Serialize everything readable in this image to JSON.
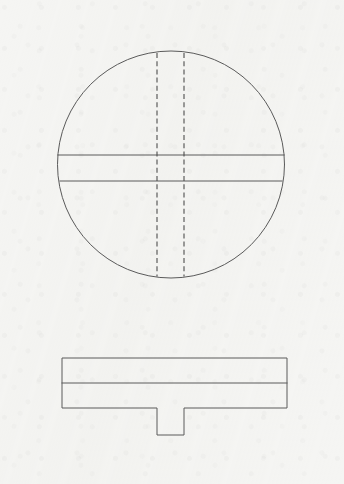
{
  "page": {
    "width": 344,
    "height": 484,
    "background_color": "#f5f5f3",
    "line_color": "#5a5a5a",
    "hidden_line_color": "#4e4e4e",
    "medium": "scanned paper"
  },
  "views": [
    {
      "id": "top-view",
      "name": "Top View (Plan)",
      "shape": "circle",
      "center": {
        "x": 171,
        "y": 164.5
      },
      "radius": 113.5,
      "bounds": {
        "left": 57.5,
        "top": 51,
        "right": 284.5,
        "bottom": 278
      },
      "features": [
        {
          "id": "chord-line-upper",
          "name": "Upper Horizontal Chord",
          "type": "visible-edge",
          "style": "solid",
          "orientation": "horizontal",
          "y": 155,
          "x1": 57.8,
          "x2": 284.2
        },
        {
          "id": "chord-line-lower",
          "name": "Lower Horizontal Chord",
          "type": "visible-edge",
          "style": "solid",
          "orientation": "horizontal",
          "y": 181,
          "x1": 60.0,
          "x2": 282.0
        },
        {
          "id": "hidden-edge-left",
          "name": "Left Hidden Tenon Edge",
          "type": "hidden-edge",
          "style": "dashed",
          "orientation": "vertical",
          "x": 157,
          "y1": 53.0,
          "y2": 276.5
        },
        {
          "id": "hidden-edge-right",
          "name": "Right Hidden Tenon Edge",
          "type": "hidden-edge",
          "style": "dashed",
          "orientation": "vertical",
          "x": 184,
          "y1": 53.0,
          "y2": 276.5
        }
      ]
    },
    {
      "id": "front-view",
      "name": "Front View (Elevation)",
      "shape": "plate-with-tenon",
      "plate": {
        "left": 62,
        "top": 358,
        "right": 287,
        "bottom": 408,
        "width": 225,
        "height": 50
      },
      "tenon": {
        "name": "Downward Tab / Tenon",
        "left": 157,
        "right": 184,
        "top": 408,
        "bottom": 435,
        "width": 27,
        "height": 27
      },
      "features": [
        {
          "id": "plate-division-line",
          "name": "Plate Division Line",
          "type": "visible-edge",
          "style": "solid",
          "orientation": "horizontal",
          "y": 383,
          "x1": 62,
          "x2": 287
        }
      ]
    }
  ],
  "annotations": {
    "dimensions": [],
    "labels": [],
    "title_block": null,
    "notes": []
  }
}
